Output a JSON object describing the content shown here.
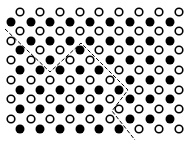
{
  "diagram": {
    "colors": {
      "background": "#ffffff",
      "ink": "#000000"
    },
    "grid": {
      "row_y": [
        12,
        22,
        31,
        41,
        50,
        60,
        70,
        80,
        90,
        99,
        109,
        119,
        129
      ],
      "cols_even_rows": [
        20,
        40,
        60,
        80,
        99,
        119,
        139,
        159,
        179
      ],
      "cols_odd_rows": [
        11,
        31,
        50,
        70,
        90,
        110,
        130,
        150,
        170
      ],
      "rows": [
        "OOOOOOOOO",
        "FFFFFFFFF",
        "OOOOOOOOO",
        "OFFFFFFFF",
        "FOOFOOOOO",
        "OOFOOFFFF",
        "FFFFFOOOO",
        "OOOOOOFFF",
        "FFFFFFOOO",
        "OOOOOOFFF",
        "FFFFFOOOO",
        "OOOOOOFFF",
        "FFFFFFOOO"
      ],
      "legend": {
        "O": "open-circle",
        "F": "filled-circle"
      },
      "radius": 4.2
    },
    "boundary": {
      "style": "dashed",
      "points": [
        [
          5,
          29
        ],
        [
          50,
          72
        ],
        [
          81,
          43
        ],
        [
          128,
          90
        ],
        [
          112,
          111
        ],
        [
          135,
          140
        ]
      ]
    }
  }
}
